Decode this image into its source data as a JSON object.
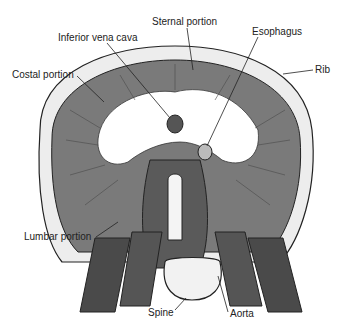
{
  "diagram": {
    "labels": {
      "sternal": "Sternal portion",
      "ivc": "Inferior vena cava",
      "esophagus": "Esophagus",
      "rib": "Rib",
      "costal": "Costal portion",
      "lumbar": "Lumbar portion",
      "spine": "Spine",
      "aorta": "Aorta"
    },
    "colors": {
      "muscle": "#7a7a7a",
      "muscle_dark": "#4a4a4a",
      "tendon": "#ffffff",
      "rib": "#e8e8e8",
      "outline": "#222222"
    }
  }
}
